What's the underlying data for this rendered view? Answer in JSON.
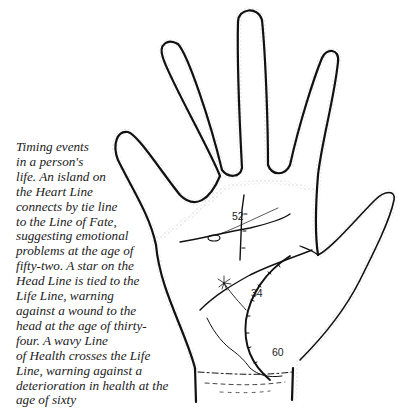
{
  "caption": {
    "text": "Timing events\nin a person's\nlife. An island on\nthe Heart Line\nconnects by tie line\nto the Line of Fate,\nsuggesting emotional\nproblems at the age of\nfifty-two. A star on the\nHead Line is tied to the\nLife Line, warning\nagainst a wound to the\nhead at the age of thirty-\nfour. A wavy Line\nof Health crosses the Life\nLine, warning against a\ndeterioration in health at the\nage of sixty"
  },
  "illustration": {
    "subject": "palm-of-right-hand",
    "age_markers": [
      {
        "label": "52",
        "line": "Line of Fate"
      },
      {
        "label": "34",
        "line": "Life Line"
      },
      {
        "label": "60",
        "line": "Life Line"
      }
    ],
    "features": [
      "Heart Line with island",
      "Line of Fate",
      "Head Line with star",
      "Life Line with age ticks",
      "Line of Health"
    ],
    "colors": {
      "ink": "#111111",
      "paper": "#ffffff",
      "stipple": "#555555"
    }
  }
}
